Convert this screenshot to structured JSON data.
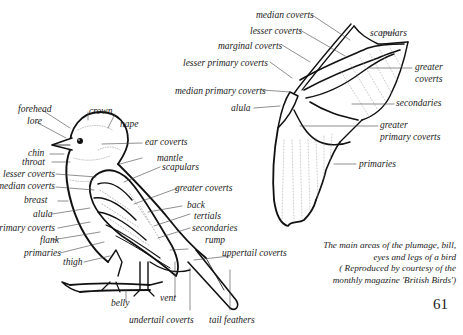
{
  "bird_labels": {
    "forehead": "forehead",
    "crown": "crown",
    "lore": "lore",
    "nape": "nape",
    "ear_coverts": "ear coverts",
    "chin": "chin",
    "throat": "throat",
    "mantle": "mantle",
    "lesser_coverts": "lesser coverts",
    "scapulars": "scapulars",
    "median_coverts": "median coverts",
    "breast": "breast",
    "greater_coverts": "greater coverts",
    "back": "back",
    "alula": "alula",
    "tertials": "tertials",
    "primary_coverts": "primary coverts",
    "secondaries": "secondaries",
    "flank": "flank",
    "rump": "rump",
    "primaries": "primaries",
    "uppertail_coverts": "uppertail coverts",
    "thigh": "thigh",
    "belly": "belly",
    "vent": "vent",
    "undertail_coverts": "undertail coverts",
    "tail_feathers": "tail feathers"
  },
  "wing_labels": {
    "median_coverts": "median coverts",
    "lesser_coverts": "lesser coverts",
    "scapulars": "scapulars",
    "marginal_coverts": "marginal coverts",
    "lesser_primary_coverts": "lesser primary coverts",
    "greater_coverts_1": "greater",
    "greater_coverts_2": "coverts",
    "median_primary_coverts": "median primary coverts",
    "alula": "alula",
    "secondaries": "secondaries",
    "greater_primary_coverts_1": "greater",
    "greater_primary_coverts_2": "primary coverts",
    "primaries": "primaries"
  },
  "caption": {
    "line1": "The main areas of the plumage, bill,",
    "line2": "eyes and legs of a bird",
    "line3": "( Reproduced by courtesy of the",
    "line4": "monthly magazine 'British Birds')"
  },
  "page_number": "61"
}
